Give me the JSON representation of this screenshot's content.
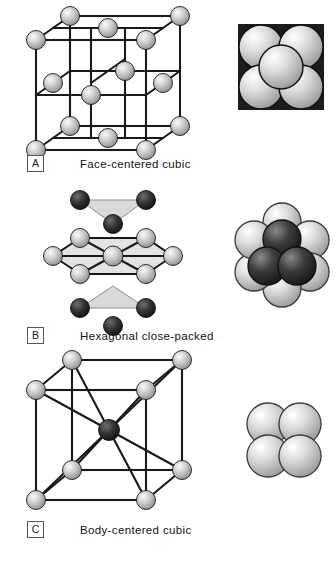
{
  "figure": {
    "background_color": "#ffffff",
    "line_color": "#1a1a1a",
    "atom_light_color": "#bdbdbd",
    "atom_dark_color": "#2b2b2b",
    "caption_font_size_px": 11.5
  },
  "panels": [
    {
      "letter": "A",
      "caption": "Face-centered cubic",
      "diagram_name": "face-centered-cubic-unit-cell",
      "packing_name": "face-centered-cubic-sphere-packing",
      "atom_count_visible": 14,
      "packing_sphere_count": 5
    },
    {
      "letter": "B",
      "caption": "Hexagonal close-packed",
      "diagram_name": "hexagonal-close-packed-unit-cell",
      "packing_name": "hexagonal-close-packed-sphere-packing",
      "atom_count_visible": 13,
      "packing_sphere_count": 9
    },
    {
      "letter": "C",
      "caption": "Body-centered cubic",
      "diagram_name": "body-centered-cubic-unit-cell",
      "packing_name": "body-centered-cubic-sphere-packing",
      "atom_count_visible": 9,
      "packing_sphere_count": 4
    }
  ]
}
